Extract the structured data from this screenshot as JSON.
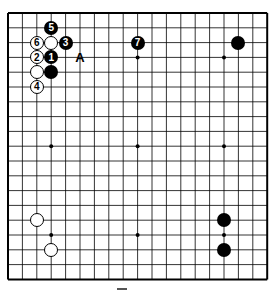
{
  "board": {
    "size": 19,
    "origin": {
      "x": 8,
      "y": 13
    },
    "spacing": {
      "x": 14.4,
      "y": 14.8
    },
    "line_color": "#000000",
    "star_points": [
      [
        3,
        3
      ],
      [
        9,
        3
      ],
      [
        15,
        3
      ],
      [
        3,
        9
      ],
      [
        9,
        9
      ],
      [
        15,
        9
      ],
      [
        3,
        15
      ],
      [
        9,
        15
      ],
      [
        15,
        15
      ]
    ]
  },
  "stones": [
    {
      "color": "black",
      "col": 3,
      "row": 1,
      "label": "5"
    },
    {
      "color": "white",
      "col": 2,
      "row": 2,
      "label": "6"
    },
    {
      "color": "white",
      "col": 3,
      "row": 2,
      "label": ""
    },
    {
      "color": "black",
      "col": 4,
      "row": 2,
      "label": "3"
    },
    {
      "color": "white",
      "col": 2,
      "row": 3,
      "label": "2"
    },
    {
      "color": "black",
      "col": 3,
      "row": 3,
      "label": "1"
    },
    {
      "color": "white",
      "col": 2,
      "row": 4,
      "label": ""
    },
    {
      "color": "black",
      "col": 3,
      "row": 4,
      "label": ""
    },
    {
      "color": "white",
      "col": 2,
      "row": 5,
      "label": "4"
    },
    {
      "color": "black",
      "col": 9,
      "row": 2,
      "label": "7"
    },
    {
      "color": "black",
      "col": 16,
      "row": 2,
      "label": ""
    },
    {
      "color": "white",
      "col": 2,
      "row": 14,
      "label": ""
    },
    {
      "color": "white",
      "col": 3,
      "row": 16,
      "label": ""
    },
    {
      "color": "black",
      "col": 15,
      "row": 14,
      "label": ""
    },
    {
      "color": "black",
      "col": 15,
      "row": 16,
      "label": ""
    }
  ],
  "markers": [
    {
      "text": "A",
      "col": 5,
      "row": 3
    }
  ]
}
